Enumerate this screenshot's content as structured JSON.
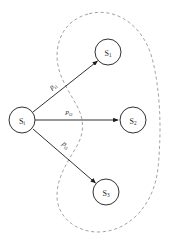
{
  "diagram": {
    "background_color": "#ffffff",
    "stroke_color": "#1a1a1a",
    "region_color": "#8c8c8c",
    "source_node": {
      "id": "Si",
      "symbol": "S",
      "subscript": "i",
      "cx": 22,
      "cy": 120,
      "r": 13
    },
    "target_nodes": [
      {
        "id": "S1",
        "symbol": "S",
        "subscript": "1",
        "cx": 108,
        "cy": 52,
        "r": 13
      },
      {
        "id": "S2",
        "symbol": "S",
        "subscript": "2",
        "cx": 133,
        "cy": 120,
        "r": 13
      },
      {
        "id": "S3",
        "symbol": "S",
        "subscript": "3",
        "cx": 106,
        "cy": 192,
        "r": 13
      }
    ],
    "edges": [
      {
        "id": "edge-i1",
        "from": "Si",
        "to": "S1",
        "symbol": "p",
        "subscript": "i1",
        "label_x": 53,
        "label_y": 86
      },
      {
        "id": "edge-i2",
        "from": "Si",
        "to": "S2",
        "symbol": "p",
        "subscript": "i2",
        "label_x": 69,
        "label_y": 112
      },
      {
        "id": "edge-i3",
        "from": "Si",
        "to": "S3",
        "symbol": "p",
        "subscript": "i3",
        "label_x": 66,
        "label_y": 145
      }
    ],
    "region": {
      "id": "target-region",
      "style": "dashed",
      "path": "M 88 14 C 66 20, 57 38, 57 56 C 57 76, 70 92, 78 108 C 84 120, 84 132, 78 144 C 68 162, 57 176, 57 196 C 57 216, 75 232, 98 232 C 128 232, 154 206, 158 168 C 162 128, 160 88, 152 58 C 144 28, 118 6, 88 14 Z"
    }
  }
}
